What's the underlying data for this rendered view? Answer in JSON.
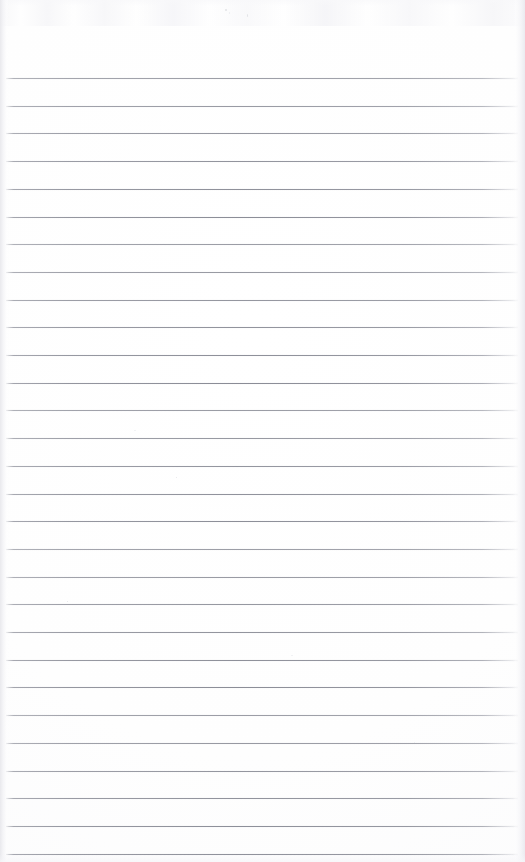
{
  "document": {
    "kind": "scanned-ruled-notebook-page",
    "title": "Blank Ruled Page",
    "content_text": "",
    "has_handwriting": false,
    "has_printed_text": false,
    "page_width_px": 525,
    "page_height_px": 862,
    "background_color": "#fdfdfe",
    "paper_tone": "near-white"
  },
  "ruling": {
    "style": "wide-ruled horizontal lines",
    "line_color": "#8a8c98",
    "line_thickness_px": 1,
    "line_count": 29,
    "first_line_y_px": 78,
    "line_spacing_px": 27.7,
    "line_start_x_px": 6,
    "line_end_x_px": 518,
    "top_margin_px": 78,
    "has_vertical_margin_rule": false
  },
  "edges": {
    "left_edge_color": "#e8e8ec",
    "right_edge_color": "#e9e9ee",
    "top_band_color": "#f4f4f7"
  },
  "artifacts": {
    "scan_noise_band_top": true,
    "specks": [
      {
        "x": 225,
        "y": 9,
        "w": 2,
        "h": 2
      },
      {
        "x": 229,
        "y": 12,
        "w": 1,
        "h": 2
      },
      {
        "x": 247,
        "y": 14,
        "w": 1,
        "h": 3
      },
      {
        "x": 134,
        "y": 430,
        "w": 2,
        "h": 1
      },
      {
        "x": 176,
        "y": 477,
        "w": 1,
        "h": 1
      },
      {
        "x": 291,
        "y": 655,
        "w": 2,
        "h": 1
      },
      {
        "x": 67,
        "y": 601,
        "w": 1,
        "h": 1
      },
      {
        "x": 414,
        "y": 742,
        "w": 1,
        "h": 1
      }
    ]
  }
}
